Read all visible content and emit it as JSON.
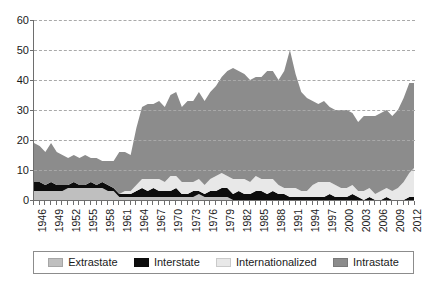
{
  "chart_data": {
    "type": "area",
    "stacked": true,
    "title": "",
    "xlabel": "",
    "ylabel": "",
    "xlim": [
      1946,
      2013
    ],
    "ylim": [
      0,
      60
    ],
    "ytick_values": [
      0,
      10,
      20,
      30,
      40,
      50,
      60
    ],
    "ytick_labels": [
      "0",
      "10",
      "20",
      "30",
      "40",
      "50",
      "60"
    ],
    "grid": true,
    "grid_style": "dashed-horizontal",
    "legend_position": "bottom",
    "x": [
      1946,
      1947,
      1948,
      1949,
      1950,
      1951,
      1952,
      1953,
      1954,
      1955,
      1956,
      1957,
      1958,
      1959,
      1960,
      1961,
      1962,
      1963,
      1964,
      1965,
      1966,
      1967,
      1968,
      1969,
      1970,
      1971,
      1972,
      1973,
      1974,
      1975,
      1976,
      1977,
      1978,
      1979,
      1980,
      1981,
      1982,
      1983,
      1984,
      1985,
      1986,
      1987,
      1988,
      1989,
      1990,
      1991,
      1992,
      1993,
      1994,
      1995,
      1996,
      1997,
      1998,
      1999,
      2000,
      2001,
      2002,
      2003,
      2004,
      2005,
      2006,
      2007,
      2008,
      2009,
      2010,
      2011,
      2012,
      2013
    ],
    "xtick_labels": [
      "1946",
      "1949",
      "1952",
      "1955",
      "1958",
      "1961",
      "1964",
      "1967",
      "1970",
      "1973",
      "1976",
      "1979",
      "1982",
      "1985",
      "1988",
      "1991",
      "1994",
      "1997",
      "2000",
      "2003",
      "2006",
      "2009",
      "2012"
    ],
    "series": [
      {
        "name": "Extrastate",
        "color": "#bfbfbf",
        "values": [
          3,
          3,
          3,
          3,
          3,
          3,
          4,
          4,
          4,
          4,
          4,
          4,
          4,
          3,
          3,
          1,
          1,
          1,
          1,
          1,
          1,
          1,
          1,
          1,
          1,
          1,
          1,
          1,
          1,
          2,
          1,
          1,
          1,
          1,
          1,
          0,
          0,
          0,
          0,
          0,
          0,
          0,
          0,
          0,
          0,
          0,
          0,
          0,
          0,
          0,
          0,
          0,
          0,
          0,
          0,
          0,
          0,
          0,
          0,
          0,
          0,
          0,
          0,
          0,
          0,
          0,
          0,
          0
        ]
      },
      {
        "name": "Interstate",
        "color": "#0d0d0d",
        "values": [
          3,
          3,
          2,
          3,
          2,
          2,
          1,
          2,
          1,
          1,
          2,
          1,
          2,
          2,
          1,
          1,
          1,
          1,
          2,
          3,
          2,
          3,
          2,
          2,
          2,
          3,
          1,
          1,
          2,
          1,
          1,
          2,
          2,
          3,
          3,
          2,
          3,
          2,
          2,
          3,
          3,
          2,
          3,
          2,
          2,
          1,
          1,
          1,
          1,
          1,
          1,
          1,
          2,
          1,
          1,
          1,
          2,
          1,
          0,
          1,
          0,
          0,
          1,
          0,
          0,
          0,
          1,
          1
        ]
      },
      {
        "name": "Internationalized",
        "color": "#e8e8e8",
        "values": [
          0,
          0,
          0,
          0,
          0,
          0,
          0,
          0,
          0,
          0,
          0,
          0,
          0,
          0,
          0,
          0,
          1,
          1,
          2,
          3,
          4,
          3,
          4,
          3,
          5,
          4,
          4,
          4,
          3,
          4,
          3,
          4,
          5,
          5,
          4,
          5,
          4,
          5,
          4,
          5,
          4,
          5,
          4,
          3,
          2,
          3,
          3,
          2,
          2,
          4,
          5,
          5,
          4,
          4,
          3,
          3,
          3,
          2,
          3,
          3,
          2,
          3,
          3,
          3,
          4,
          6,
          8,
          10
        ]
      },
      {
        "name": "Intrastate",
        "color": "#8c8c8c",
        "values": [
          13,
          12,
          11,
          13,
          11,
          10,
          9,
          9,
          9,
          10,
          8,
          9,
          7,
          8,
          9,
          14,
          13,
          12,
          19,
          24,
          25,
          25,
          26,
          25,
          27,
          28,
          25,
          27,
          27,
          29,
          28,
          29,
          30,
          32,
          35,
          37,
          36,
          35,
          34,
          33,
          34,
          36,
          36,
          35,
          39,
          46,
          38,
          33,
          31,
          28,
          26,
          27,
          25,
          25,
          26,
          26,
          24,
          23,
          25,
          24,
          26,
          26,
          26,
          25,
          26,
          28,
          30,
          28
        ]
      }
    ]
  },
  "legend": {
    "items": [
      {
        "label": "Extrastate"
      },
      {
        "label": "Interstate"
      },
      {
        "label": "Internationalized"
      },
      {
        "label": "Intrastate"
      }
    ]
  }
}
